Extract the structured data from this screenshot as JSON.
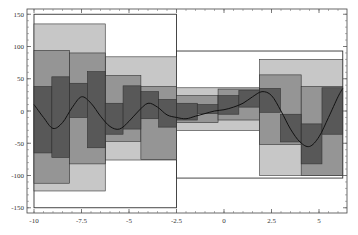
{
  "chart_data": {
    "type": "bar",
    "subtype": "hierarchical-box-decomposition",
    "title": "",
    "xlabel": "",
    "ylabel": "",
    "xlim": [
      -10.4,
      6.5
    ],
    "ylim": [
      -155,
      155
    ],
    "grid": false,
    "legend": null,
    "x_ticks": [
      -10,
      -7.5,
      -5,
      -2.5,
      0,
      2.5,
      5
    ],
    "x_tick_labels": [
      "-10",
      "-7.5",
      "-5",
      "-2.5",
      "0",
      "2.5",
      "5"
    ],
    "y_ticks": [
      150,
      100,
      50,
      0,
      -50,
      -100,
      -150
    ],
    "y_tick_labels": [
      "150",
      "100",
      "50",
      "0",
      "-50",
      "-100",
      "-150"
    ],
    "series": [
      {
        "name": "level-0",
        "fill": "#ffffff",
        "boxes": [
          {
            "x0": -10,
            "x1": -2.5,
            "y0": -150,
            "y1": 150
          },
          {
            "x0": -2.5,
            "x1": 6.25,
            "y0": -104,
            "y1": 93
          }
        ]
      },
      {
        "name": "level-1",
        "fill": "#bdbdbd",
        "boxes": [
          {
            "x0": -10,
            "x1": -6.25,
            "y0": -124,
            "y1": 135
          },
          {
            "x0": -6.25,
            "x1": -2.5,
            "y0": -76,
            "y1": 84
          },
          {
            "x0": -2.5,
            "x1": 1.875,
            "y0": -30,
            "y1": 36
          },
          {
            "x0": 1.875,
            "x1": 6.25,
            "y0": -100,
            "y1": 80
          }
        ]
      },
      {
        "name": "level-2",
        "fill": "#8c8c8c",
        "boxes": [
          {
            "x0": -10,
            "x1": -8.125,
            "y0": -112,
            "y1": 94
          },
          {
            "x0": -8.125,
            "x1": -6.25,
            "y0": -82,
            "y1": 90
          },
          {
            "x0": -6.25,
            "x1": -4.375,
            "y0": -47,
            "y1": 55
          },
          {
            "x0": -4.375,
            "x1": -2.5,
            "y0": -75,
            "y1": 38
          },
          {
            "x0": -2.5,
            "x1": -0.3125,
            "y0": -18,
            "y1": 24
          },
          {
            "x0": -0.3125,
            "x1": 1.875,
            "y0": -14,
            "y1": 34
          },
          {
            "x0": 1.875,
            "x1": 4.0625,
            "y0": -52,
            "y1": 56
          },
          {
            "x0": 4.0625,
            "x1": 6.25,
            "y0": -100,
            "y1": 38
          }
        ]
      },
      {
        "name": "level-3",
        "fill": "#4d4d4d",
        "boxes": [
          {
            "x0": -10,
            "x1": -9.0625,
            "y0": -65,
            "y1": 38
          },
          {
            "x0": -9.0625,
            "x1": -8.125,
            "y0": -72,
            "y1": 53
          },
          {
            "x0": -8.125,
            "x1": -7.1875,
            "y0": -10,
            "y1": 43
          },
          {
            "x0": -7.1875,
            "x1": -6.25,
            "y0": -57,
            "y1": 61
          },
          {
            "x0": -6.25,
            "x1": -5.3125,
            "y0": -36,
            "y1": 12
          },
          {
            "x0": -5.3125,
            "x1": -4.375,
            "y0": -28,
            "y1": 39
          },
          {
            "x0": -4.375,
            "x1": -3.4375,
            "y0": -12,
            "y1": 30
          },
          {
            "x0": -3.4375,
            "x1": -2.5,
            "y0": -25,
            "y1": 18
          },
          {
            "x0": -2.5,
            "x1": -1.40625,
            "y0": -14,
            "y1": 12
          },
          {
            "x0": -1.40625,
            "x1": -0.3125,
            "y0": -4,
            "y1": 10
          },
          {
            "x0": -0.3125,
            "x1": 0.78125,
            "y0": -5,
            "y1": 24
          },
          {
            "x0": 0.78125,
            "x1": 1.875,
            "y0": 6,
            "y1": 32
          },
          {
            "x0": 1.875,
            "x1": 2.96875,
            "y0": -2,
            "y1": 35
          },
          {
            "x0": 2.96875,
            "x1": 4.0625,
            "y0": -48,
            "y1": -5
          },
          {
            "x0": 4.0625,
            "x1": 5.15625,
            "y0": -82,
            "y1": -20
          },
          {
            "x0": 5.15625,
            "x1": 6.25,
            "y0": -36,
            "y1": 36
          }
        ]
      }
    ],
    "curve": {
      "name": "signal",
      "color": "#111111",
      "x": [
        -10,
        -9.5,
        -9,
        -8.5,
        -8,
        -7.5,
        -7,
        -6.5,
        -6,
        -5.5,
        -5,
        -4.5,
        -4,
        -3.5,
        -3,
        -2.5,
        -2,
        -1.5,
        -1,
        -0.5,
        0,
        0.5,
        1,
        1.5,
        2,
        2.5,
        3,
        3.5,
        4,
        4.5,
        5,
        5.5,
        6,
        6.25
      ],
      "y": [
        10,
        -10,
        -27,
        -18,
        5,
        22,
        12,
        -8,
        -24,
        -28,
        -16,
        0,
        12,
        6,
        -6,
        -10,
        -12,
        -8,
        -4,
        0,
        2,
        6,
        12,
        22,
        30,
        24,
        0,
        -28,
        -48,
        -55,
        -40,
        -10,
        22,
        35
      ]
    }
  }
}
